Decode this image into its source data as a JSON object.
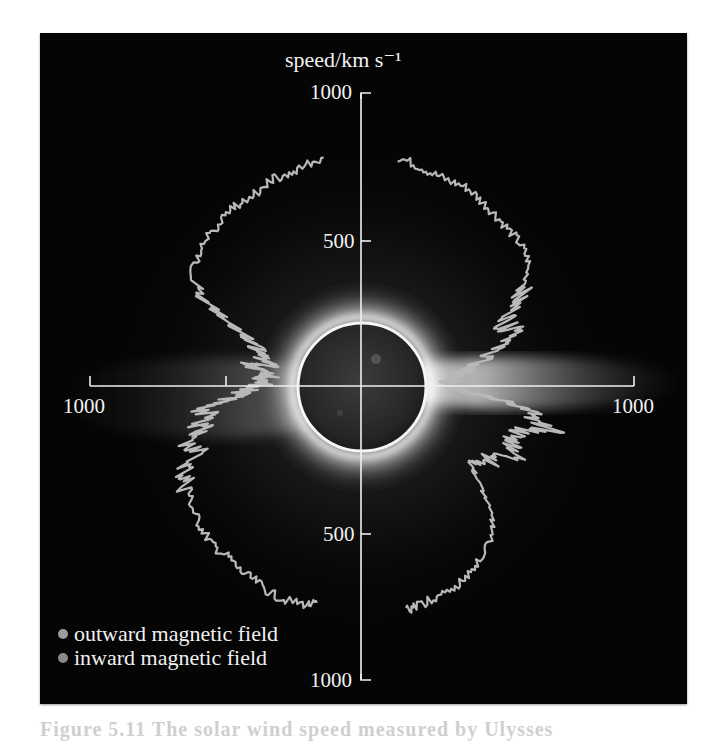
{
  "figure": {
    "caption_visible": "Figure 5.11 The solar wind speed measured by Ulysses"
  },
  "colors": {
    "background": "#050505",
    "axis": "#f0f0f0",
    "trace": "#b8b8b8",
    "outward_dot": "#9c9c9c",
    "inward_dot": "#8a8a8a",
    "sun_disk": "#2a2a2a",
    "corona": "#ffffff"
  },
  "chart_data": {
    "type": "polar-line",
    "title": "",
    "radial_axis_label": "speed/km s⁻¹",
    "radial_unit": "km s^-1",
    "axes": {
      "vertical": {
        "top_label": "1000",
        "upper_mid_label": "500",
        "lower_mid_label": "500",
        "bottom_label": "1000"
      },
      "horizontal": {
        "left_label": "1000",
        "right_label": "1000",
        "left_mid_tick": 500
      }
    },
    "radial_range": [
      0,
      1000
    ],
    "ticks": [
      500,
      1000
    ],
    "grid": false,
    "angle_convention": "heliographic latitude in degrees; +90 north (top), -90 south (bottom); left half and right half are two traces",
    "legend": [
      {
        "label": "outward magnetic field",
        "color": "#9c9c9c"
      },
      {
        "label": "inward magnetic field",
        "color": "#8a8a8a"
      }
    ],
    "legend_position": "lower-left",
    "series": [
      {
        "name": "left-half trace",
        "side": "left",
        "points_lat_speed": [
          [
            80,
            790
          ],
          [
            75,
            780
          ],
          [
            70,
            770
          ],
          [
            65,
            775
          ],
          [
            60,
            760
          ],
          [
            55,
            765
          ],
          [
            50,
            770
          ],
          [
            45,
            760
          ],
          [
            40,
            755
          ],
          [
            35,
            740
          ],
          [
            30,
            720
          ],
          [
            27,
            650
          ],
          [
            25,
            560
          ],
          [
            22,
            470
          ],
          [
            20,
            420
          ],
          [
            17,
            400
          ],
          [
            14,
            380
          ],
          [
            12,
            340
          ],
          [
            10,
            420
          ],
          [
            8,
            380
          ],
          [
            6,
            330
          ],
          [
            4,
            360
          ],
          [
            2,
            340
          ],
          [
            0,
            380
          ],
          [
            -2,
            420
          ],
          [
            -4,
            450
          ],
          [
            -6,
            520
          ],
          [
            -8,
            600
          ],
          [
            -10,
            560
          ],
          [
            -12,
            620
          ],
          [
            -14,
            600
          ],
          [
            -17,
            680
          ],
          [
            -20,
            620
          ],
          [
            -23,
            700
          ],
          [
            -26,
            720
          ],
          [
            -30,
            730
          ],
          [
            -35,
            750
          ],
          [
            -40,
            760
          ],
          [
            -45,
            770
          ],
          [
            -50,
            760
          ],
          [
            -55,
            770
          ],
          [
            -60,
            770
          ],
          [
            -65,
            780
          ],
          [
            -70,
            780
          ],
          [
            -75,
            770
          ],
          [
            -78,
            760
          ]
        ]
      },
      {
        "name": "right-half trace",
        "side": "right",
        "points_lat_speed": [
          [
            80,
            790
          ],
          [
            75,
            780
          ],
          [
            70,
            770
          ],
          [
            65,
            770
          ],
          [
            60,
            780
          ],
          [
            55,
            770
          ],
          [
            50,
            765
          ],
          [
            45,
            760
          ],
          [
            40,
            760
          ],
          [
            35,
            750
          ],
          [
            30,
            700
          ],
          [
            27,
            650
          ],
          [
            24,
            600
          ],
          [
            21,
            560
          ],
          [
            18,
            640
          ],
          [
            15,
            520
          ],
          [
            12,
            480
          ],
          [
            10,
            420
          ],
          [
            8,
            380
          ],
          [
            6,
            360
          ],
          [
            4,
            330
          ],
          [
            2,
            330
          ],
          [
            0,
            350
          ],
          [
            -2,
            380
          ],
          [
            -4,
            420
          ],
          [
            -6,
            560
          ],
          [
            -8,
            640
          ],
          [
            -10,
            620
          ],
          [
            -12,
            720
          ],
          [
            -14,
            620
          ],
          [
            -17,
            580
          ],
          [
            -20,
            600
          ],
          [
            -23,
            620
          ],
          [
            -26,
            560
          ],
          [
            -30,
            520
          ],
          [
            -33,
            480
          ],
          [
            -36,
            520
          ],
          [
            -40,
            600
          ],
          [
            -45,
            690
          ],
          [
            -50,
            720
          ],
          [
            -55,
            740
          ],
          [
            -60,
            760
          ],
          [
            -65,
            770
          ],
          [
            -70,
            770
          ],
          [
            -75,
            780
          ],
          [
            -78,
            780
          ]
        ]
      }
    ]
  },
  "legend": {
    "outward": "outward magnetic field",
    "inward": "inward magnetic field"
  },
  "labels": {
    "axis_title": "speed/km s⁻¹",
    "top_1000": "1000",
    "upper_500": "500",
    "lower_500": "500",
    "bottom_1000": "1000",
    "left_1000": "1000",
    "right_1000": "1000"
  }
}
